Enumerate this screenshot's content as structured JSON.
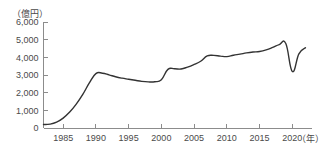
{
  "chart_data": {
    "type": "line",
    "title": "",
    "subtitle": "",
    "xlabel": "（年）",
    "ylabel": "（億円）",
    "ylim": [
      0,
      6000
    ],
    "xlim": [
      1982,
      2023
    ],
    "grid": false,
    "legend": false,
    "legend_position": "none",
    "y_ticks": [
      "0",
      "1,000",
      "2,000",
      "3,000",
      "4,000",
      "5,000",
      "6,000"
    ],
    "y_tick_values": [
      0,
      1000,
      2000,
      3000,
      4000,
      5000,
      6000
    ],
    "x_ticks": [
      "1985",
      "1990",
      "1995",
      "2000",
      "2005",
      "2010",
      "2015",
      "2020"
    ],
    "x_tick_values": [
      1985,
      1990,
      1995,
      2000,
      2005,
      2010,
      2015,
      2020
    ],
    "series": [
      {
        "name": "金額",
        "color": "#333333",
        "x": [
          1982,
          1983,
          1984,
          1985,
          1986,
          1987,
          1988,
          1989,
          1990,
          1991,
          1992,
          1993,
          1994,
          1995,
          1996,
          1997,
          1998,
          1999,
          2000,
          2001,
          2002,
          2003,
          2004,
          2005,
          2006,
          2007,
          2008,
          2009,
          2010,
          2011,
          2012,
          2013,
          2014,
          2015,
          2016,
          2017,
          2018,
          2019,
          2020,
          2021,
          2022
        ],
        "values": [
          200,
          220,
          330,
          560,
          900,
          1350,
          1900,
          2550,
          3080,
          3100,
          3010,
          2900,
          2820,
          2760,
          2700,
          2640,
          2610,
          2620,
          2730,
          3320,
          3350,
          3340,
          3450,
          3600,
          3780,
          4080,
          4110,
          4070,
          4040,
          4120,
          4180,
          4250,
          4300,
          4330,
          4420,
          4560,
          4720,
          4780,
          3200,
          4200,
          4540
        ]
      }
    ]
  },
  "axes": {
    "y_unit_label": "（億円）",
    "x_unit_label": "（年）"
  }
}
